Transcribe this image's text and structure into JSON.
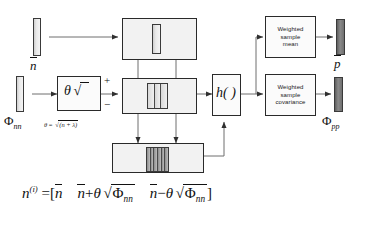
{
  "diagram": {
    "type": "block-diagram",
    "line_color": "#3a3a3a",
    "box_fill": "#f2f2f2",
    "vector_light_fill": "#e4e4e4",
    "vector_dark_fill": "#7a7a7a"
  },
  "inputs": {
    "mean_vector": {
      "name": "n-bar-input-vector",
      "label_base": "n",
      "label_overbar": true
    },
    "covariance_vector": {
      "name": "phi-nn-input-vector",
      "label_base": "Φ",
      "label_subscript": "nn"
    }
  },
  "blocks": {
    "scale": {
      "label_theta": "θ",
      "label_radical": "√",
      "definition": "θ = √(n + λ)",
      "def_theta": "θ",
      "def_equals": "=",
      "def_radicand": "(n + λ)"
    },
    "sum_junction": {
      "plus": "+",
      "minus": "−"
    },
    "mean_replicate": {
      "name": "mean-replicate-block"
    },
    "spread_block": {
      "name": "sigma-spread-block"
    },
    "sigma_points_block": {
      "name": "sigma-point-set-block"
    },
    "nonlinear": {
      "label": "h( )",
      "name": "nonlinear-transform-block"
    },
    "weighted_mean": {
      "lines": [
        "Weighted",
        "sample",
        "mean"
      ]
    },
    "weighted_covariance": {
      "lines": [
        "Weighted",
        "sample",
        "covariance"
      ]
    }
  },
  "outputs": {
    "mean": {
      "name": "p-bar-output-vector",
      "label_base": "p",
      "label_overbar": true
    },
    "covariance": {
      "name": "phi-pp-output-vector",
      "label_base": "Φ",
      "label_subscript": "pp"
    }
  },
  "equation": {
    "lhs_base": "n",
    "lhs_superscript": "(i)",
    "equals": "=",
    "open_bracket": "[",
    "term1": "n",
    "term2_op": "+",
    "term3_op": "−",
    "theta": "θ",
    "radical": "√",
    "phi": "Φ",
    "phi_sub": "nn",
    "close_bracket": "]",
    "full_text": "n^(i) = [ n̄   n̄ + θ√Φnn   n̄ − θ√Φnn ]"
  }
}
